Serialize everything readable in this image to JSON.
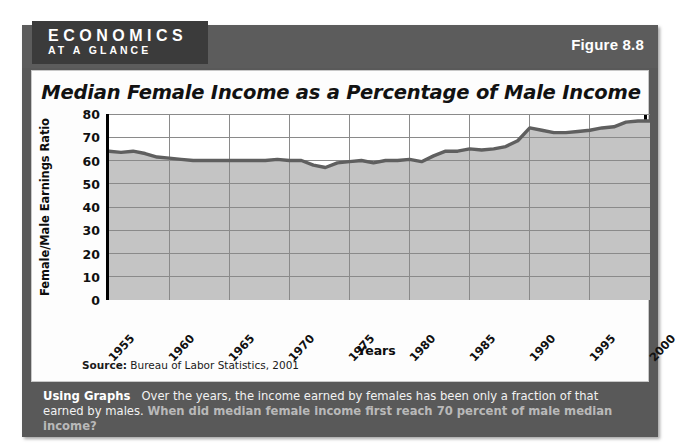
{
  "header": {
    "brand_line1": "ECONOMICS",
    "brand_line2": "AT A GLANCE",
    "figure_label": "Figure 8.8"
  },
  "chart_panel": {
    "title": "Median Female Income as a Percentage of Male Income",
    "source_prefix": "Source:",
    "source_text": " Bureau of Labor Statistics, 2001"
  },
  "caption": {
    "heading": "Using Graphs",
    "body": "Over the years, the income earned by females has been only a fraction of that earned by males.",
    "question": "When did median female income first reach 70 percent of male median income?"
  },
  "colors": {
    "frame": "#595959",
    "header_band": "#5c5c5c",
    "logo_block": "#3b3b3b",
    "panel": "#fdfdfd",
    "line": "#5f5f5f",
    "area_fill": "#c4c4c4",
    "gridline": "#8a8a8a",
    "axis": "#000000"
  },
  "chart_data": {
    "type": "area",
    "title": "Median Female Income as a Percentage of Male Income",
    "xlabel": "Years",
    "ylabel": "Female/Male Earnings Ratio",
    "xlim": [
      1955,
      2000
    ],
    "ylim": [
      0,
      80
    ],
    "yticks": [
      80,
      70,
      60,
      50,
      40,
      30,
      20,
      10,
      0
    ],
    "xticks": [
      1955,
      1960,
      1965,
      1970,
      1975,
      1980,
      1985,
      1990,
      1995,
      2000
    ],
    "grid": true,
    "legend": null,
    "series": [
      {
        "name": "Female/Male Earnings Ratio",
        "x": [
          1955,
          1956,
          1957,
          1958,
          1959,
          1960,
          1961,
          1962,
          1963,
          1964,
          1965,
          1966,
          1967,
          1968,
          1969,
          1970,
          1971,
          1972,
          1973,
          1974,
          1975,
          1976,
          1977,
          1978,
          1979,
          1980,
          1981,
          1982,
          1983,
          1984,
          1985,
          1986,
          1987,
          1988,
          1989,
          1990,
          1991,
          1992,
          1993,
          1994,
          1995,
          1996,
          1997,
          1998,
          1999,
          2000
        ],
        "values": [
          64,
          63.5,
          64,
          63,
          61.5,
          61,
          60.5,
          60,
          60,
          60,
          60,
          60,
          60,
          60,
          60.5,
          60,
          60,
          58,
          57,
          59,
          59.5,
          60,
          59,
          60,
          60,
          60.5,
          59.5,
          62,
          64,
          64,
          65,
          64.5,
          65,
          66,
          68.5,
          74,
          73,
          72,
          72,
          72.5,
          73,
          74,
          74.5,
          76.5,
          77,
          77
        ]
      }
    ]
  }
}
